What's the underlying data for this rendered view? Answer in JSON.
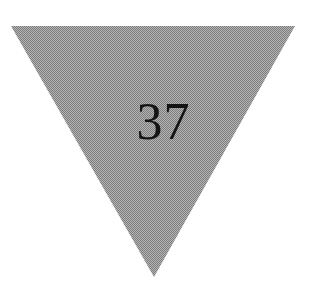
{
  "image": {
    "background_color": "#ffffff",
    "width": 311,
    "height": 299
  },
  "shape": {
    "name": "downward-triangle",
    "label": "37",
    "fill_color": "#9a9a9a",
    "fill_style": "dithered-halftone",
    "text_color": "#141414",
    "vertices": "11,26 295,26 154,277",
    "orientation": "point-down"
  },
  "chart_data": {
    "type": "table",
    "title": "",
    "categories": [
      "shape"
    ],
    "values": [
      37
    ],
    "annotations": [
      "37"
    ]
  }
}
